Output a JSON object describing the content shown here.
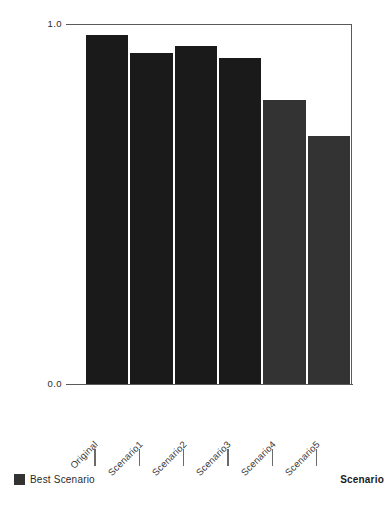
{
  "chart_data": {
    "type": "bar",
    "title": "",
    "subtitle": "",
    "xlabel": "Scenario",
    "ylabel": "",
    "categories": [
      "Original",
      "Scenario1",
      "Scenario2",
      "Scenario3",
      "Scenario4",
      "Scenario5"
    ],
    "values": [
      0.97,
      0.92,
      0.94,
      0.905,
      0.79,
      0.69
    ],
    "series": [
      {
        "name": "Scenario",
        "values": [
          0.97,
          0.92,
          0.94,
          0.905,
          0.79,
          0.69
        ],
        "colors": [
          "#1a1a1a",
          "#1a1a1a",
          "#1a1a1a",
          "#1a1a1a",
          "#333333",
          "#333333"
        ]
      }
    ],
    "highlight_group": "Best Scenario",
    "highlight_categories": [
      "Scenario4",
      "Scenario5"
    ],
    "ylim": [
      0.0,
      1.0
    ],
    "ytick_labels": [
      "1.0",
      "0.0"
    ],
    "ytick_values": [
      1.0,
      0.0
    ],
    "grid": false,
    "legend": {
      "position": "bottom-left",
      "entries": [
        {
          "label": "Best Scenario",
          "color": "#333333",
          "swatch": "square"
        }
      ]
    },
    "bar_color_default": "#1a1a1a",
    "bar_color_highlight": "#333333",
    "axis_color": "#5a5a5a",
    "background": "#ffffff"
  },
  "axis": {
    "y_top_label": "1.0",
    "y_bottom_label": "0.0",
    "x_title": "Scenario"
  },
  "legend": {
    "best_scenario_label": "Best Scenario"
  }
}
